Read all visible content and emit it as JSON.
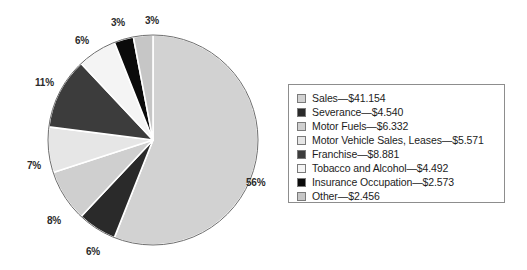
{
  "chart_data": {
    "type": "pie",
    "title": "",
    "subtitle": "",
    "xlabel": "",
    "ylabel": "",
    "grid": false,
    "legend_position": "right",
    "units": "millions of dollars",
    "total": "$76.000",
    "categories": [
      "Sales",
      "Severance",
      "Motor Fuels",
      "Motor Vehicle Sales, Leases",
      "Franchise",
      "Tobacco and Alcohol",
      "Insurance Occupation",
      "Other"
    ],
    "values": [
      41.154,
      4.54,
      6.332,
      5.571,
      8.881,
      4.492,
      2.573,
      2.456
    ],
    "value_labels": [
      "$41.154",
      "$4.540",
      "$6.332",
      "$5.571",
      "$8.881",
      "$4.492",
      "$2.573",
      "$2.456"
    ],
    "percent_values": [
      56,
      6,
      8,
      7,
      11,
      6,
      3,
      3
    ],
    "percent_labels": [
      "56%",
      "6%",
      "8%",
      "7%",
      "11%",
      "6%",
      "3%",
      "3%"
    ],
    "colors": [
      "#d2d2d2",
      "#2a2a2a",
      "#cfcfcf",
      "#e6e6e6",
      "#3c3c3c",
      "#f4f4f4",
      "#0b0b0b",
      "#c6c6c6"
    ],
    "slices": [
      {
        "name": "Sales",
        "value": 41.154,
        "value_label": "$41.154",
        "percent": 56,
        "percent_label": "56%",
        "color": "#d2d2d2"
      },
      {
        "name": "Severance",
        "value": 4.54,
        "value_label": "$4.540",
        "percent": 6,
        "percent_label": "6%",
        "color": "#2a2a2a"
      },
      {
        "name": "Motor Fuels",
        "value": 6.332,
        "value_label": "$6.332",
        "percent": 8,
        "percent_label": "8%",
        "color": "#cfcfcf"
      },
      {
        "name": "Motor Vehicle Sales, Leases",
        "value": 5.571,
        "value_label": "$5.571",
        "percent": 7,
        "percent_label": "7%",
        "color": "#e6e6e6"
      },
      {
        "name": "Franchise",
        "value": 8.881,
        "value_label": "$8.881",
        "percent": 11,
        "percent_label": "11%",
        "color": "#3c3c3c"
      },
      {
        "name": "Tobacco and Alcohol",
        "value": 4.492,
        "value_label": "$4.492",
        "percent": 6,
        "percent_label": "6%",
        "color": "#f4f4f4"
      },
      {
        "name": "Insurance Occupation",
        "value": 2.573,
        "value_label": "$2.573",
        "percent": 3,
        "percent_label": "3%",
        "color": "#0b0b0b"
      },
      {
        "name": "Other",
        "value": 2.456,
        "value_label": "$2.456",
        "percent": 3,
        "percent_label": "3%",
        "color": "#c6c6c6"
      }
    ]
  },
  "pie": {
    "center_x": 153,
    "center_y": 140,
    "radius": 105,
    "start_angle_deg": 0,
    "direction": "clockwise",
    "separator_color": "#ffffff",
    "outline_color": "#6e6e6e",
    "labels": [
      {
        "text": "56%",
        "x": 246,
        "y": 177
      },
      {
        "text": "6%",
        "x": 86,
        "y": 246
      },
      {
        "text": "8%",
        "x": 47,
        "y": 215
      },
      {
        "text": "7%",
        "x": 27,
        "y": 160
      },
      {
        "text": "11%",
        "x": 35,
        "y": 77
      },
      {
        "text": "6%",
        "x": 75,
        "y": 35
      },
      {
        "text": "3%",
        "x": 111,
        "y": 17
      },
      {
        "text": "3%",
        "x": 145,
        "y": 15
      }
    ]
  },
  "legend": {
    "border_color": "#8d8d8d",
    "entries": [
      {
        "label": "Sales—$41.154",
        "swatch": "#d2d2d2"
      },
      {
        "label": "Severance—$4.540",
        "swatch": "#2a2a2a"
      },
      {
        "label": "Motor Fuels—$6.332",
        "swatch": "#cfcfcf"
      },
      {
        "label": "Motor Vehicle Sales, Leases—$5.571",
        "swatch": "#e6e6e6"
      },
      {
        "label": "Franchise—$8.881",
        "swatch": "#3c3c3c"
      },
      {
        "label": "Tobacco and Alcohol—$4.492",
        "swatch": "#f4f4f4"
      },
      {
        "label": "Insurance Occupation—$2.573",
        "swatch": "#0b0b0b"
      },
      {
        "label": "Other—$2.456",
        "swatch": "#c6c6c6"
      }
    ]
  }
}
